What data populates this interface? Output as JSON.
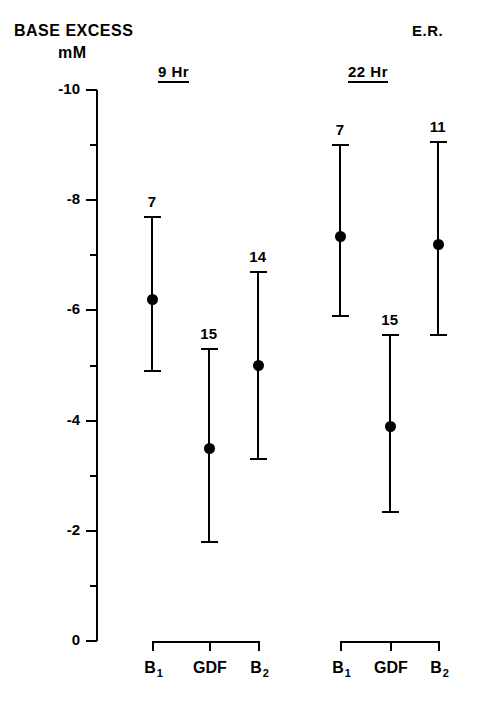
{
  "header": {
    "title_line1": "BASE EXCESS",
    "title_line2": "mM",
    "corner_label": "E.R."
  },
  "chart_data": {
    "type": "scatter",
    "title": "BASE EXCESS",
    "ylabel": "mM",
    "xlabel": "",
    "annotation": "E.R.",
    "ylim": [
      -10,
      0
    ],
    "y_axis_inverted": true,
    "grid": false,
    "legend": "none",
    "y_major_ticks": [
      "-10",
      "-8",
      "-6",
      "-4",
      "-2",
      "0"
    ],
    "y_major_values": [
      -10,
      -8,
      -6,
      -4,
      -2,
      0
    ],
    "y_minor_values": [
      -9,
      -7,
      -5,
      -3,
      -1
    ],
    "categories": [
      "B1",
      "GDF",
      "B2"
    ],
    "category_labels": [
      "B",
      "GDF",
      "B"
    ],
    "category_subscripts": [
      "1",
      "",
      "2"
    ],
    "groups": [
      {
        "label": "9 Hr",
        "points": [
          {
            "category": "B1",
            "mean": -6.2,
            "upper": -7.7,
            "lower": -4.9,
            "n": "7"
          },
          {
            "category": "GDF",
            "mean": -3.5,
            "upper": -5.3,
            "lower": -1.8,
            "n": "15"
          },
          {
            "category": "B2",
            "mean": -5.0,
            "upper": -6.7,
            "lower": -3.3,
            "n": "14"
          }
        ]
      },
      {
        "label": "22 Hr",
        "points": [
          {
            "category": "B1",
            "mean": -7.35,
            "upper": -9.0,
            "lower": -5.9,
            "n": "7"
          },
          {
            "category": "GDF",
            "mean": -3.9,
            "upper": -5.55,
            "lower": -2.35,
            "n": "15"
          },
          {
            "category": "B2",
            "mean": -7.2,
            "upper": -9.05,
            "lower": -5.55,
            "n": "11"
          }
        ]
      }
    ]
  },
  "colors": {
    "ink": "#000000",
    "background": "#ffffff"
  }
}
